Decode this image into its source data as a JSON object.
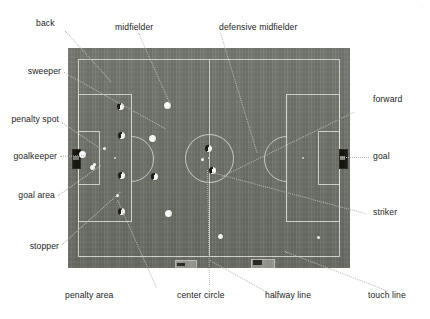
{
  "figure": {
    "kind": "annotated-photograph",
    "corner_mark": "…"
  },
  "labels": {
    "top": [
      {
        "id": "back",
        "text": "back"
      },
      {
        "id": "midfielder",
        "text": "midfielder"
      },
      {
        "id": "defensive-midfielder",
        "text": "defensive midfielder"
      }
    ],
    "left": [
      {
        "id": "sweeper",
        "text": "sweeper"
      },
      {
        "id": "penalty-spot",
        "text": "penalty spot"
      },
      {
        "id": "goalkeeper",
        "text": "goalkeeper"
      },
      {
        "id": "goal-area",
        "text": "goal area"
      },
      {
        "id": "stopper",
        "text": "stopper"
      }
    ],
    "right": [
      {
        "id": "forward",
        "text": "forward"
      },
      {
        "id": "goal",
        "text": "goal"
      },
      {
        "id": "striker",
        "text": "striker"
      }
    ],
    "bottom": [
      {
        "id": "penalty-area",
        "text": "penalty area"
      },
      {
        "id": "center-circle",
        "text": "center circle"
      },
      {
        "id": "halfway-line",
        "text": "halfway line"
      },
      {
        "id": "touch-line",
        "text": "touch line"
      }
    ]
  },
  "colors": {
    "grass": "#6e7268",
    "markings": "#e8e9e4",
    "leader_line": "#b9b9b4",
    "label_text": "#1d1d1d",
    "player_dark": "#17170f",
    "player_light": "#f2f3ee",
    "background": "#ffffff"
  },
  "field": {
    "x": 68,
    "y": 48,
    "width": 282,
    "height": 220,
    "markings": [
      "touch-line",
      "goal-line",
      "halfway-line",
      "center-circle",
      "center-spot",
      "penalty-area-left",
      "penalty-area-right",
      "goal-area-left",
      "goal-area-right",
      "penalty-spot-left",
      "penalty-spot-right",
      "penalty-arc-left",
      "penalty-arc-right",
      "goal-left",
      "goal-right"
    ]
  },
  "players": [
    {
      "id": "goalkeeper",
      "team": "light",
      "x": 82,
      "y": 155
    },
    {
      "id": "sweeper",
      "team": "light",
      "x": 92,
      "y": 168
    },
    {
      "id": "back-left",
      "team": "dark",
      "x": 120,
      "y": 106
    },
    {
      "id": "stopper",
      "team": "dark",
      "x": 121,
      "y": 135
    },
    {
      "id": "back-right",
      "team": "dark",
      "x": 121,
      "y": 175
    },
    {
      "id": "back-wide",
      "team": "dark",
      "x": 121,
      "y": 211
    },
    {
      "id": "midfielder-high",
      "team": "light",
      "x": 167,
      "y": 105
    },
    {
      "id": "midfielder-center",
      "team": "light",
      "x": 152,
      "y": 138
    },
    {
      "id": "midfielder-low",
      "team": "dark",
      "x": 154,
      "y": 176
    },
    {
      "id": "midfielder-wide",
      "team": "light",
      "x": 168,
      "y": 213
    },
    {
      "id": "def-midfielder-a",
      "team": "dark",
      "x": 208,
      "y": 148
    },
    {
      "id": "def-midfielder-b",
      "team": "dark",
      "x": 212,
      "y": 170
    },
    {
      "id": "forward",
      "team": "light",
      "x": 219,
      "y": 236
    }
  ],
  "balls": [
    {
      "id": "ball-penalty-spot",
      "x": 105,
      "y": 150
    },
    {
      "id": "ball-goal-area",
      "x": 95,
      "y": 166
    },
    {
      "id": "ball-box-edge",
      "x": 118,
      "y": 197
    },
    {
      "id": "ball-center",
      "x": 204,
      "y": 160
    },
    {
      "id": "ball-right-half",
      "x": 319,
      "y": 239
    }
  ]
}
